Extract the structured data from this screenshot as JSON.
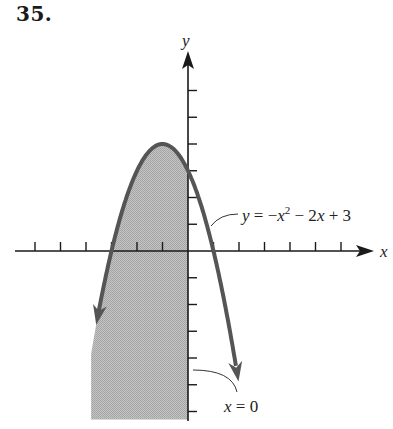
{
  "problem": {
    "number": "35."
  },
  "axes": {
    "x_label": "x",
    "y_label": "y",
    "origin_px": [
      188,
      251
    ],
    "x_unit_px": 25.5,
    "y_unit_px": 26.75,
    "x_ticks": [
      -6,
      -5,
      -4,
      -3,
      -2,
      -1,
      1,
      2,
      3,
      4,
      5,
      6
    ],
    "y_ticks": [
      -6,
      -5,
      -4,
      -3,
      -2,
      -1,
      1,
      2,
      3,
      4,
      5,
      6
    ]
  },
  "labels": {
    "curve": {
      "y": "y",
      "eq": " = −",
      "x": "x",
      "sup": "2",
      "rest1": " − 2",
      "x2": "x",
      "rest2": " + 3"
    },
    "boundary": {
      "x": "x",
      "rest": " = 0"
    }
  },
  "colors": {
    "curve": "#555555",
    "shade": "#b8b8b8",
    "axis": "#1a1a1a"
  },
  "chart_data": {
    "type": "area",
    "title": "35.",
    "xlabel": "x",
    "ylabel": "y",
    "curves": [
      {
        "name": "y = −x² − 2x + 3",
        "kind": "parabola",
        "vertex": [
          -1,
          4
        ],
        "x_intercepts": [
          -3,
          1
        ],
        "y_intercept": 3,
        "x_range": [
          -3.6,
          2.0
        ]
      },
      {
        "name": "x = 0",
        "kind": "vertical-line",
        "x": 0
      }
    ],
    "shaded_region": "y ≤ −x² − 2x + 3 and x ≤ 0",
    "xlim": [
      -6.7,
      7.2
    ],
    "ylim": [
      -6.3,
      7.4
    ],
    "grid": false
  }
}
